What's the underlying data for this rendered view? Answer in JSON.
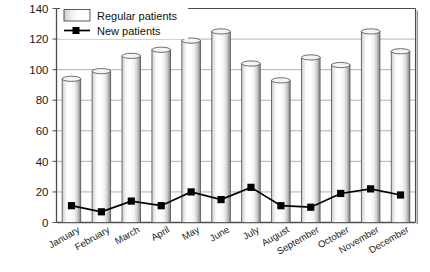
{
  "chart_data": {
    "type": "bar",
    "title": "",
    "xlabel": "",
    "ylabel": "",
    "ylim": [
      0,
      140
    ],
    "ytick_step": 20,
    "grid": true,
    "legend_position": "top-left",
    "categories": [
      "January",
      "February",
      "March",
      "April",
      "May",
      "June",
      "July",
      "August",
      "September",
      "October",
      "November",
      "December"
    ],
    "ytick_labels": [
      "0",
      "20",
      "40",
      "60",
      "80",
      "100",
      "120",
      "140"
    ],
    "series": [
      {
        "name": "Regular patients",
        "type": "bar",
        "values": [
          94,
          99,
          109,
          113,
          119,
          125,
          104,
          93,
          108,
          103,
          125,
          112
        ]
      },
      {
        "name": "New patients",
        "type": "line",
        "marker": "square",
        "values": [
          11,
          7,
          14,
          11,
          20,
          15,
          23,
          11,
          10,
          19,
          22,
          18
        ]
      }
    ],
    "colors": {
      "bar_fill_light": "#ffffff",
      "bar_fill_shade": "#b9b9b9",
      "bar_outline": "#555555",
      "line": "#000000",
      "marker": "#000000",
      "grid": "#a8a8a8",
      "axis": "#4d4d4d",
      "text": "#1a1a1a"
    }
  },
  "legend": {
    "items": [
      {
        "label": "Regular patients",
        "kind": "swatch"
      },
      {
        "label": "New patients",
        "kind": "line-marker"
      }
    ]
  }
}
